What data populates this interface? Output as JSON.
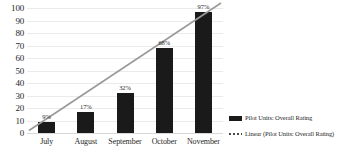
{
  "chart_data": {
    "type": "bar",
    "title": "",
    "xlabel": "",
    "ylabel": "",
    "categories": [
      "July",
      "August",
      "September",
      "October",
      "November"
    ],
    "values": [
      9,
      17,
      32,
      68,
      97
    ],
    "data_labels": [
      "9%",
      "17%",
      "32%",
      "68%",
      "97%"
    ],
    "ylim": [
      0,
      100
    ],
    "ytick_step": 10,
    "yticks": [
      "100",
      "90",
      "80",
      "70",
      "60",
      "50",
      "40",
      "30",
      "20",
      "10",
      "0"
    ],
    "grid": true,
    "legend_position": "right",
    "series": [
      {
        "name": "Pilot Units: Overall Rating",
        "type": "bar",
        "color": "#1a1a1a",
        "values": [
          9,
          17,
          32,
          68,
          97
        ]
      },
      {
        "name": "Linear (Pilot Units: Overall Rating)",
        "type": "trendline",
        "color": "#9a9a9a",
        "style": "solid",
        "start_value": 2,
        "end_value": 104
      }
    ]
  },
  "legend": {
    "items": [
      {
        "label": "Pilot Units: Overall Rating",
        "swatch": "solid"
      },
      {
        "label": "Linear (Pilot Units: Overall Rating)",
        "swatch": "dotted"
      }
    ]
  },
  "colors": {
    "bar": "#1a1a1a",
    "trendline": "#9a9a9a",
    "gridline": "#eceaea",
    "text": "#1f1f1f",
    "background": "#ffffff"
  }
}
